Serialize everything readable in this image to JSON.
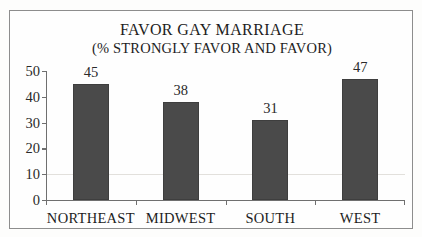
{
  "chart_data": {
    "type": "bar",
    "title": "FAVOR GAY MARRIAGE",
    "subtitle": "(% STRONGLY FAVOR AND FAVOR)",
    "xlabel": "",
    "ylabel": "",
    "categories": [
      "NORTHEAST",
      "MIDWEST",
      "SOUTH",
      "WEST"
    ],
    "values": [
      45,
      38,
      31,
      47
    ],
    "value_labels": [
      "45",
      "38",
      "31",
      "47"
    ],
    "ylim": [
      0,
      50
    ],
    "yticks": [
      0,
      10,
      20,
      30,
      40,
      50
    ],
    "ytick_labels": [
      "0",
      "10",
      "20",
      "30",
      "40",
      "50"
    ],
    "grid": true,
    "gridline_values": [
      10
    ],
    "legend": false,
    "legend_position": "none",
    "bar_color": "#4a4a4a",
    "axis_color": "#6f6f6f",
    "text_color": "#1d1d1d",
    "background_color": "#fefefe",
    "frame_color": "#8d8d8d"
  }
}
